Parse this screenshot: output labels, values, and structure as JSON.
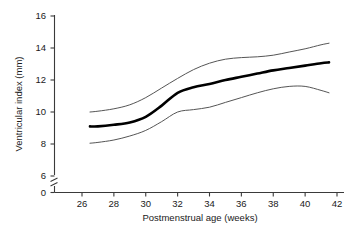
{
  "chart_data": {
    "type": "line",
    "title": "",
    "xlabel": "Postmenstrual age (weeks)",
    "ylabel": "Ventricular index (mm)",
    "xlim": [
      25,
      42
    ],
    "ylim": [
      0,
      16
    ],
    "y_axis_break": {
      "between": [
        0,
        6
      ],
      "present": true
    },
    "xticks": [
      26,
      28,
      30,
      32,
      34,
      36,
      38,
      40,
      42
    ],
    "xticklabels": [
      "26",
      "28",
      "30",
      "32",
      "34",
      "36",
      "38",
      "40",
      "42"
    ],
    "yticks": [
      0,
      6,
      8,
      10,
      12,
      14,
      16
    ],
    "yticklabels": [
      "0",
      "6",
      "8",
      "10",
      "12",
      "14",
      "16"
    ],
    "grid": false,
    "legend": "none",
    "x": [
      26.5,
      27,
      28,
      29,
      30,
      31,
      32,
      33,
      34,
      35,
      36,
      37,
      38,
      39,
      40,
      41,
      41.5
    ],
    "series": [
      {
        "name": "upper centile",
        "style": "thin",
        "values": [
          10.0,
          10.05,
          10.2,
          10.45,
          10.9,
          11.5,
          12.1,
          12.65,
          13.05,
          13.3,
          13.4,
          13.45,
          13.55,
          13.75,
          13.95,
          14.2,
          14.3
        ]
      },
      {
        "name": "median",
        "style": "thick",
        "values": [
          9.1,
          9.1,
          9.2,
          9.35,
          9.7,
          10.4,
          11.2,
          11.55,
          11.75,
          12.0,
          12.2,
          12.4,
          12.6,
          12.75,
          12.9,
          13.05,
          13.1
        ]
      },
      {
        "name": "lower centile",
        "style": "thin",
        "values": [
          8.05,
          8.1,
          8.25,
          8.5,
          8.85,
          9.4,
          10.0,
          10.15,
          10.3,
          10.6,
          10.9,
          11.2,
          11.45,
          11.6,
          11.6,
          11.35,
          11.2
        ]
      }
    ]
  },
  "axes": {
    "x_label": "Postmenstrual age (weeks)",
    "y_label": "Ventricular index (mm)"
  },
  "colors": {
    "axis": "#3a3a3a",
    "median_line": "#000000",
    "centile_line": "#555555",
    "background": "#ffffff",
    "text": "#1a1a1a"
  }
}
